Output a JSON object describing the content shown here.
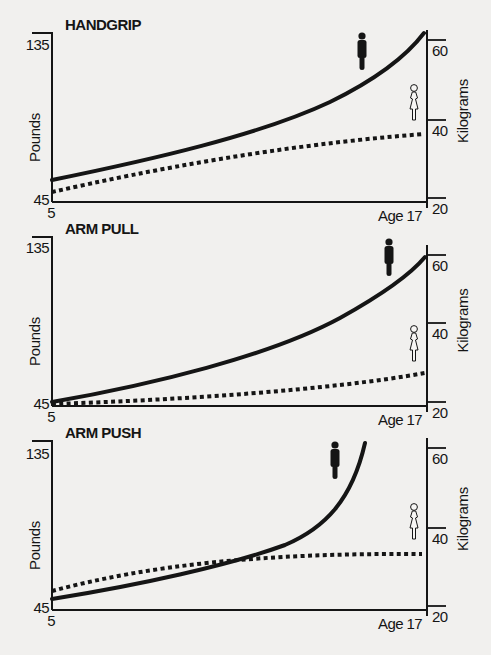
{
  "figure": {
    "background": "#f1f0ee",
    "ink": "#151515",
    "left_axis_label": "Pounds",
    "right_axis_label": "Kilograms",
    "x_start_label": "5",
    "x_end_label": "Age 17",
    "legend": {
      "male": {
        "icon": "male-figure-icon",
        "style": "solid line",
        "fill": "#151515"
      },
      "female": {
        "icon": "female-figure-icon",
        "style": "dotted line",
        "fill": "none"
      }
    }
  },
  "chart_data": [
    {
      "type": "line",
      "title": "HANDGRIP",
      "xlabel": "Age",
      "ylabel": "Pounds",
      "ylabel_right": "Kilograms",
      "x_range": [
        5,
        17
      ],
      "x_tick_labels": [
        "5",
        "Age 17"
      ],
      "ylim_left": [
        45,
        135
      ],
      "y_ticks_left": [
        "135",
        "45"
      ],
      "y_ticks_right": [
        "60",
        "40",
        "20"
      ],
      "grid": false,
      "x": [
        5,
        7,
        9,
        11,
        13,
        15,
        17
      ],
      "series": [
        {
          "name": "Male",
          "style": "solid",
          "values": [
            56,
            62,
            69,
            78,
            91,
            108,
            133
          ]
        },
        {
          "name": "Female",
          "style": "dotted",
          "values": [
            50,
            58,
            65,
            71,
            76,
            80,
            83
          ]
        }
      ]
    },
    {
      "type": "line",
      "title": "ARM PULL",
      "xlabel": "Age",
      "ylabel": "Pounds",
      "ylabel_right": "Kilograms",
      "x_range": [
        5,
        17
      ],
      "x_tick_labels": [
        "5",
        "Age 17"
      ],
      "ylim_left": [
        45,
        135
      ],
      "y_ticks_left": [
        "135",
        "45"
      ],
      "y_ticks_right": [
        "60",
        "40",
        "20"
      ],
      "grid": false,
      "x": [
        5,
        7,
        9,
        11,
        13,
        15,
        17
      ],
      "series": [
        {
          "name": "Male",
          "style": "solid",
          "values": [
            47,
            54,
            62,
            72,
            85,
            101,
            125
          ]
        },
        {
          "name": "Female",
          "style": "dotted",
          "values": [
            46,
            47,
            49,
            51,
            54,
            58,
            63
          ]
        }
      ]
    },
    {
      "type": "line",
      "title": "ARM PUSH",
      "xlabel": "Age",
      "ylabel": "Pounds",
      "ylabel_right": "Kilograms",
      "x_range": [
        5,
        17
      ],
      "x_tick_labels": [
        "5",
        "Age 17"
      ],
      "ylim_left": [
        45,
        135
      ],
      "y_ticks_left": [
        "135",
        "45"
      ],
      "y_ticks_right": [
        "60",
        "40",
        "20"
      ],
      "grid": false,
      "x": [
        5,
        7,
        9,
        11,
        13,
        15,
        17
      ],
      "series": [
        {
          "name": "Male",
          "style": "solid",
          "values": [
            51,
            57,
            64,
            72,
            86,
            130,
            null
          ]
        },
        {
          "name": "Female",
          "style": "dotted",
          "values": [
            55,
            62,
            68,
            72,
            74,
            75,
            75
          ]
        }
      ]
    }
  ],
  "panels": [
    {
      "title": "HANDGRIP",
      "frame": {
        "left": 52,
        "top": 33,
        "bottom": 202,
        "right": 427,
        "y135": 45
      },
      "right_ticks_y": [
        40,
        120,
        198
      ],
      "male_path": "M52,180 C150,160 260,135 330,102 C375,80 405,58 424,33",
      "female_path": "M52,192 C150,170 280,145 424,134",
      "male_icon": {
        "x": 357,
        "y": 32
      },
      "female_icon": {
        "x": 409,
        "y": 84
      }
    },
    {
      "title": "ARM PULL",
      "frame": {
        "left": 52,
        "top": 237,
        "bottom": 406,
        "right": 427,
        "y135": 248
      },
      "right_ticks_y": [
        255,
        323,
        402
      ],
      "male_path": "M52,402 C150,385 270,356 340,318 C385,293 410,275 425,257",
      "female_path": "M52,404 C180,400 330,390 425,373",
      "male_icon": {
        "x": 384,
        "y": 238
      },
      "female_icon": {
        "x": 409,
        "y": 325
      }
    },
    {
      "title": "ARM PUSH",
      "frame": {
        "left": 52,
        "top": 441,
        "bottom": 610,
        "right": 427,
        "y135": 454
      },
      "right_ticks_y": [
        448,
        528,
        606
      ],
      "male_path": "M52,599 C140,585 230,565 285,545 C325,528 352,500 365,443",
      "female_path": "M52,591 C150,565 260,553 422,554",
      "male_icon": {
        "x": 330,
        "y": 441
      },
      "female_icon": {
        "x": 409,
        "y": 503
      }
    }
  ]
}
